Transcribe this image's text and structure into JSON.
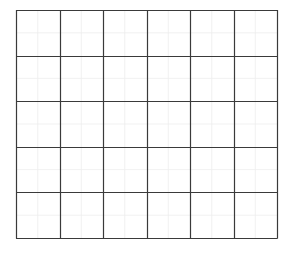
{
  "grid": {
    "columns": 6,
    "rows": 5,
    "left": 16,
    "top": 10,
    "right": 277,
    "bottom": 238,
    "subdivisions": 2,
    "colors": {
      "background": "#ffffff",
      "major_line": "#3a3a3a",
      "minor_line": "#eeeeee"
    },
    "major_line_width": 1.2,
    "minor_line_width": 0.8
  }
}
